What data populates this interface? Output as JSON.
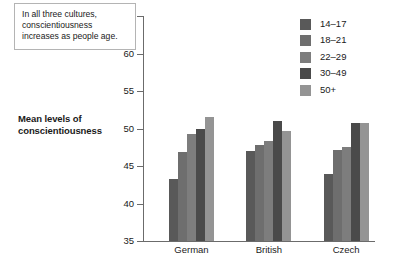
{
  "chart_data": {
    "type": "bar",
    "title": "",
    "xlabel": "",
    "ylabel": "Mean levels of conscientiousness",
    "ylim": [
      35,
      65
    ],
    "ytick_step": 5,
    "yticks": [
      65,
      60,
      55,
      50,
      45,
      40,
      35
    ],
    "grid": false,
    "legend_position": "top-right",
    "categories": [
      "German",
      "British",
      "Czech"
    ],
    "series": [
      {
        "name": "14–17",
        "color": "#595959",
        "values": [
          43.3,
          47.0,
          44.0
        ]
      },
      {
        "name": "18–21",
        "color": "#6e6e6e",
        "values": [
          46.9,
          47.8,
          47.1
        ]
      },
      {
        "name": "22–29",
        "color": "#7d7d7d",
        "values": [
          49.3,
          48.4,
          47.6
        ]
      },
      {
        "name": "30–49",
        "color": "#4a4a4a",
        "values": [
          50.0,
          51.0,
          50.8
        ]
      },
      {
        "name": "50+",
        "color": "#949494",
        "values": [
          51.6,
          49.7,
          50.8
        ]
      }
    ],
    "annotations": [
      {
        "name": "callout",
        "lines": [
          "In all three cultures,",
          "conscientiousness",
          "increases as people age."
        ]
      }
    ]
  },
  "axis_title": {
    "line1": "Mean levels of",
    "line2": "conscientiousness"
  },
  "colors": {
    "axis": "#6b6b6b",
    "text": "#1a1a1a",
    "callout_border": "#b4b4b4",
    "background": "#ffffff"
  }
}
